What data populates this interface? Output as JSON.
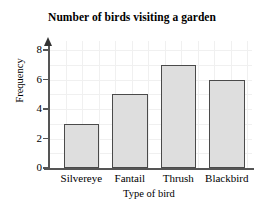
{
  "chart_data": {
    "type": "bar",
    "title": "Number of birds visiting a garden",
    "xlabel": "Type of bird",
    "ylabel": "Frequency",
    "categories": [
      "Silvereye",
      "Fantail",
      "Thrush",
      "Blackbird"
    ],
    "values": [
      3,
      5,
      7,
      6
    ],
    "ylim": [
      0,
      9
    ],
    "yticks": [
      0,
      2,
      4,
      6,
      8
    ],
    "ytick_labels": [
      "0",
      "2",
      "4",
      "6",
      "8"
    ],
    "grid": true,
    "legend": null,
    "bar_fill_color": "#dedede",
    "bar_edge_color": "#4a4a4a",
    "axis_color": "#555555",
    "grid_color": "#f0f0f0",
    "background_color": "#ffffff",
    "text_color": "#000000"
  }
}
